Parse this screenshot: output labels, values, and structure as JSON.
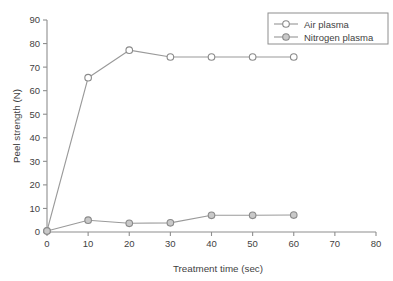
{
  "chart_data": {
    "type": "line",
    "title": "",
    "xlabel": "Treatment time (sec)",
    "ylabel": "Peel strength (N)",
    "xlim": [
      0,
      80
    ],
    "ylim": [
      0,
      90
    ],
    "xticks": [
      0,
      10,
      20,
      30,
      40,
      50,
      60,
      70,
      80
    ],
    "yticks": [
      0,
      10,
      20,
      30,
      40,
      50,
      60,
      70,
      80,
      90
    ],
    "xtick_labels": [
      "0",
      "10",
      "20",
      "30",
      "40",
      "50",
      "60",
      "70",
      "80"
    ],
    "ytick_labels": [
      "0",
      "10",
      "20",
      "30",
      "40",
      "50",
      "60",
      "70",
      "80",
      "90"
    ],
    "grid": false,
    "legend_position": "upper right",
    "x": [
      0,
      10,
      20,
      30,
      40,
      50,
      60
    ],
    "series": [
      {
        "name": "Air plasma",
        "marker": "open-circle",
        "values": [
          0.5,
          65.5,
          77.2,
          74.3,
          74.3,
          74.3,
          74.3
        ]
      },
      {
        "name": "Nitrogen plasma",
        "marker": "filled-circle",
        "values": [
          0.4,
          5.0,
          3.7,
          3.9,
          7.1,
          7.1,
          7.2
        ]
      }
    ]
  },
  "legend": {
    "entries": [
      {
        "label": "Air plasma"
      },
      {
        "label": "Nitrogen plasma"
      }
    ]
  },
  "colors": {
    "axis": "#8e8e8e",
    "text": "#3f3f3f",
    "series_air": "#9a9a9a",
    "series_nitrogen": "#9a9a9a",
    "marker_air_fill": "#ffffff",
    "marker_nitrogen_fill": "#c9c9c9",
    "marker_stroke": "#8a8a8a",
    "background": "#ffffff"
  }
}
